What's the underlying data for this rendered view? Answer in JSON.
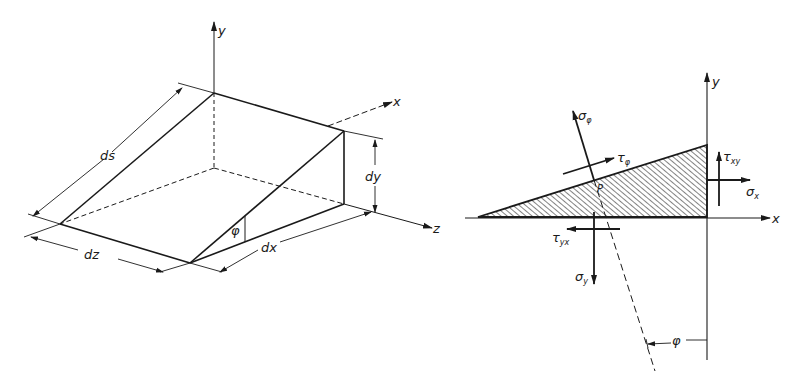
{
  "figure_left": {
    "title": "Inclined volume element",
    "labels": {
      "axis_x": "x",
      "axis_y": "y",
      "axis_z": "z",
      "dim_ds": "ds",
      "dim_dx": "dx",
      "dim_dy": "dy",
      "dim_dz": "dz",
      "angle": "φ"
    }
  },
  "figure_right": {
    "title": "Stresses on inclined plane",
    "labels": {
      "axis_x": "x",
      "axis_y": "y",
      "point": "P",
      "angle": "φ",
      "sigma_phi": "σ",
      "sigma_phi_sub": "φ",
      "tau_phi": "τ",
      "tau_phi_sub": "φ",
      "tau_xy": "τ",
      "tau_xy_sub": "xy",
      "sigma_x": "σ",
      "sigma_x_sub": "x",
      "tau_yx": "τ",
      "tau_yx_sub": "yx",
      "sigma_y": "σ",
      "sigma_y_sub": "y"
    }
  },
  "colors": {
    "ink": "#1a1a1a",
    "paper": "#ffffff"
  }
}
